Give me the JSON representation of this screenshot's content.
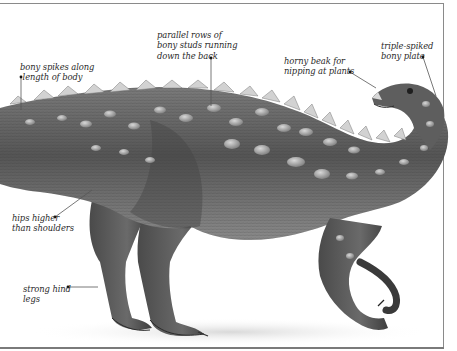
{
  "figure": {
    "colors": {
      "background": "#ffffff",
      "frame": "#8a8a8a",
      "skin_dark": "#3c3c3c",
      "skin_mid": "#6e6e6e",
      "skin_light": "#a8a8a8",
      "label_text": "#2a2a2a",
      "leader_line": "#555555"
    }
  },
  "annotations": [
    {
      "id": "bony-spikes",
      "text": "bony spikes along\n length of body"
    },
    {
      "id": "bony-studs",
      "text": "parallel rows of\nbony studs running\ndown the back"
    },
    {
      "id": "horny-beak",
      "text": "horny beak for\nnipping at plants"
    },
    {
      "id": "triple-spiked-plate",
      "text": "triple-spiked\nbony plate"
    },
    {
      "id": "hips",
      "text": "hips higher\nthan shoulders"
    },
    {
      "id": "hind-legs",
      "text": "strong hind\nlegs"
    }
  ]
}
